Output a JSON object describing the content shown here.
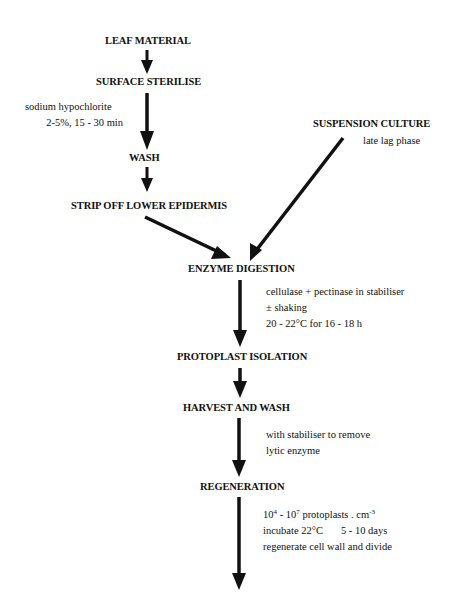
{
  "diagram": {
    "type": "flowchart",
    "nodes": {
      "leaf_material": "LEAF MATERIAL",
      "surface_sterilise": "SURFACE STERILISE",
      "wash": "WASH",
      "strip_off": "STRIP OFF LOWER EPIDERMIS",
      "suspension_culture": "SUSPENSION CULTURE",
      "enzyme_digestion": "ENZYME DIGESTION",
      "protoplast_isolation": "PROTOPLAST ISOLATION",
      "harvest_and_wash": "HARVEST AND WASH",
      "regeneration": "REGENERATION"
    },
    "notes": {
      "sterilise": [
        "sodium hypochlorite",
        "2-5%,  15 - 30 min"
      ],
      "suspension": "late lag phase",
      "digestion": [
        "cellulase + pectinase in stabiliser",
        "± shaking",
        "20 - 22°C for 16 - 18 h"
      ],
      "harvest": [
        "with stabiliser to remove",
        "lytic enzyme"
      ],
      "regeneration": {
        "density_a": "10",
        "density_a_exp": "4",
        "density_sep": " - 10",
        "density_b_exp": "7",
        "density_unit": " protoplasts . cm",
        "density_unit_exp": "-3",
        "incubate": "incubate 22°C",
        "days": "5 - 10 days",
        "outcome": "regenerate cell wall and divide"
      }
    },
    "edges": [
      {
        "from": "LEAF MATERIAL",
        "to": "SURFACE STERILISE"
      },
      {
        "from": "SURFACE STERILISE",
        "to": "WASH"
      },
      {
        "from": "WASH",
        "to": "STRIP OFF LOWER EPIDERMIS"
      },
      {
        "from": "STRIP OFF LOWER EPIDERMIS",
        "to": "ENZYME DIGESTION"
      },
      {
        "from": "SUSPENSION CULTURE",
        "to": "ENZYME DIGESTION"
      },
      {
        "from": "ENZYME DIGESTION",
        "to": "PROTOPLAST ISOLATION"
      },
      {
        "from": "PROTOPLAST ISOLATION",
        "to": "HARVEST AND WASH"
      },
      {
        "from": "HARVEST AND WASH",
        "to": "REGENERATION"
      },
      {
        "from": "REGENERATION",
        "to": "(continues)"
      }
    ]
  }
}
